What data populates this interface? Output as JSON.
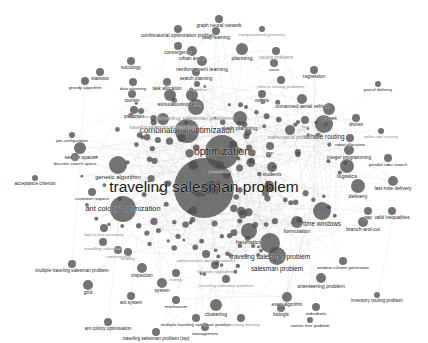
{
  "figure": {
    "type": "network-graph",
    "title": "",
    "background_color": "#ffffff",
    "node_color": "#4d4d4d",
    "edge_color": "#bdbdbd",
    "label_color": "#1a1a1a"
  },
  "chart_data": {
    "type": "scatter",
    "title": "",
    "xlabel": "",
    "ylabel": "",
    "grid": false,
    "legend": "none",
    "nodes": [
      {
        "label": "traveling salesman problem",
        "x": 204,
        "y": 188,
        "size": 30,
        "font": 15.5,
        "faint": false
      },
      {
        "label": "optimization",
        "x": 222,
        "y": 152,
        "size": 17,
        "font": 10.5,
        "faint": false
      },
      {
        "label": "combinatorial optimization",
        "x": 187,
        "y": 131,
        "size": 12,
        "font": 8.2,
        "faint": false
      },
      {
        "label": "ant colony optimization",
        "x": 123,
        "y": 209,
        "size": 13,
        "font": 7.4,
        "faint": false
      },
      {
        "label": "traveling salesman problems",
        "x": 196,
        "y": 107,
        "size": 8,
        "font": 6.0,
        "faint": true
      },
      {
        "label": "traveling salesman problem (tsp)",
        "x": 163,
        "y": 119,
        "size": 6,
        "font": 4.6,
        "faint": true
      },
      {
        "label": "time windows",
        "x": 322,
        "y": 211,
        "size": 9,
        "font": 6.3,
        "faint": false
      },
      {
        "label": "heuristics",
        "x": 249,
        "y": 231,
        "size": 8,
        "font": 6.2,
        "faint": false
      },
      {
        "label": "traveling salesman problem",
        "x": 270,
        "y": 243,
        "size": 10,
        "font": 6.6,
        "faint": false
      },
      {
        "label": "salesman problem",
        "x": 277,
        "y": 256,
        "size": 9,
        "font": 6.4,
        "faint": false
      },
      {
        "label": "formulation",
        "x": 297,
        "y": 222,
        "size": 6,
        "font": 5.4,
        "faint": false
      },
      {
        "label": "branch-and-cut",
        "x": 363,
        "y": 222,
        "size": 5,
        "font": 5.0,
        "faint": false
      },
      {
        "label": "valid inequalities",
        "x": 392,
        "y": 211,
        "size": 4,
        "font": 4.8,
        "faint": false
      },
      {
        "label": "gap",
        "x": 368,
        "y": 211,
        "size": 4,
        "font": 4.6,
        "faint": false
      },
      {
        "label": "delivery",
        "x": 358,
        "y": 186,
        "size": 7,
        "font": 5.6,
        "faint": false
      },
      {
        "label": "last-mile delivery",
        "x": 393,
        "y": 181,
        "size": 5,
        "font": 5.0,
        "faint": false
      },
      {
        "label": "logistics",
        "x": 347,
        "y": 166,
        "size": 7,
        "font": 5.6,
        "faint": false
      },
      {
        "label": "vehicle routing",
        "x": 324,
        "y": 124,
        "size": 9,
        "font": 6.4,
        "faint": false
      },
      {
        "label": "drones",
        "x": 329,
        "y": 109,
        "size": 6,
        "font": 5.2,
        "faint": false
      },
      {
        "label": "drones",
        "x": 356,
        "y": 118,
        "size": 4,
        "font": 4.6,
        "faint": false
      },
      {
        "label": "unmanned aerial vehicle",
        "x": 302,
        "y": 99,
        "size": 5,
        "font": 5.0,
        "faint": false
      },
      {
        "label": "robot allocation",
        "x": 350,
        "y": 138,
        "size": 4,
        "font": 4.4,
        "faint": false
      },
      {
        "label": "value-cap scenery",
        "x": 381,
        "y": 131,
        "size": 3,
        "font": 4.2,
        "faint": true
      },
      {
        "label": "integer programming",
        "x": 349,
        "y": 150,
        "size": 5,
        "font": 4.8,
        "faint": false
      },
      {
        "label": "parallel tabu search",
        "x": 388,
        "y": 158,
        "size": 4,
        "font": 4.4,
        "faint": false
      },
      {
        "label": "parcel delivery",
        "x": 378,
        "y": 84,
        "size": 3,
        "font": 4.4,
        "faint": false
      },
      {
        "label": "regression",
        "x": 314,
        "y": 70,
        "size": 4,
        "font": 4.8,
        "faint": false
      },
      {
        "label": "vehicle routing problems",
        "x": 281,
        "y": 80,
        "size": 4,
        "font": 4.4,
        "faint": true
      },
      {
        "label": "routing problems",
        "x": 276,
        "y": 51,
        "size": 4,
        "font": 4.6,
        "faint": true
      },
      {
        "label": "costs",
        "x": 274,
        "y": 63,
        "size": 4,
        "font": 4.4,
        "faint": false
      },
      {
        "label": "planning",
        "x": 242,
        "y": 49,
        "size": 6,
        "font": 5.6,
        "faint": false
      },
      {
        "label": "computational geometry",
        "x": 262,
        "y": 29,
        "size": 3,
        "font": 4.4,
        "faint": true
      },
      {
        "label": "graph neural network",
        "x": 219,
        "y": 19,
        "size": 4,
        "font": 4.8,
        "faint": false
      },
      {
        "label": "combinatorial optimization problem",
        "x": 178,
        "y": 29,
        "size": 4,
        "font": 4.8,
        "faint": false
      },
      {
        "label": "deep learning",
        "x": 216,
        "y": 31,
        "size": 4,
        "font": 4.6,
        "faint": false
      },
      {
        "label": "convergence",
        "x": 178,
        "y": 46,
        "size": 4,
        "font": 4.8,
        "faint": false
      },
      {
        "label": "urban areas",
        "x": 192,
        "y": 51,
        "size": 5,
        "font": 5.0,
        "faint": false
      },
      {
        "label": "reinforcement learning",
        "x": 202,
        "y": 61,
        "size": 5,
        "font": 5.2,
        "faint": false
      },
      {
        "label": "search planning",
        "x": 196,
        "y": 72,
        "size": 4,
        "font": 4.6,
        "faint": false
      },
      {
        "label": "completion",
        "x": 197,
        "y": 84,
        "size": 3,
        "font": 4.2,
        "faint": true
      },
      {
        "label": "sociology",
        "x": 131,
        "y": 61,
        "size": 4,
        "font": 4.8,
        "faint": false
      },
      {
        "label": "statistics",
        "x": 100,
        "y": 72,
        "size": 4,
        "font": 4.6,
        "faint": false
      },
      {
        "label": "greedy algorithm",
        "x": 85,
        "y": 81,
        "size": 4,
        "font": 4.4,
        "faint": false
      },
      {
        "label": "data planning",
        "x": 133,
        "y": 82,
        "size": 4,
        "font": 4.4,
        "faint": false
      },
      {
        "label": "task allocation",
        "x": 167,
        "y": 82,
        "size": 4,
        "font": 4.6,
        "faint": false
      },
      {
        "label": "tourism",
        "x": 132,
        "y": 94,
        "size": 4,
        "font": 4.6,
        "faint": false
      },
      {
        "label": "simulation",
        "x": 170,
        "y": 95,
        "size": 6,
        "font": 5.6,
        "faint": false
      },
      {
        "label": "modeling",
        "x": 192,
        "y": 95,
        "size": 6,
        "font": 5.4,
        "faint": false
      },
      {
        "label": "generation",
        "x": 141,
        "y": 111,
        "size": 3,
        "font": 4.0,
        "faint": true
      },
      {
        "label": "prediction",
        "x": 134,
        "y": 110,
        "size": 4,
        "font": 4.6,
        "faint": false
      },
      {
        "label": "path planning",
        "x": 240,
        "y": 118,
        "size": 7,
        "font": 5.8,
        "faint": false
      },
      {
        "label": "mathematical problem",
        "x": 290,
        "y": 130,
        "size": 5,
        "font": 4.6,
        "faint": true
      },
      {
        "label": "search space",
        "x": 80,
        "y": 148,
        "size": 6,
        "font": 5.2,
        "faint": false
      },
      {
        "label": "discrete search space",
        "x": 75,
        "y": 157,
        "size": 4,
        "font": 4.4,
        "faint": false
      },
      {
        "label": "pre-configuration",
        "x": 72,
        "y": 135,
        "size": 3,
        "font": 4.2,
        "faint": false
      },
      {
        "label": "acceptance criterion",
        "x": 35,
        "y": 178,
        "size": 3,
        "font": 4.6,
        "faint": false
      },
      {
        "label": "customer request",
        "x": 92,
        "y": 192,
        "size": 4,
        "font": 4.4,
        "faint": false
      },
      {
        "label": "genetic algorithm",
        "x": 118,
        "y": 165,
        "size": 9,
        "font": 6.0,
        "faint": false
      },
      {
        "label": "students",
        "x": 272,
        "y": 167,
        "size": 5,
        "font": 5.0,
        "faint": false
      },
      {
        "label": "presentation",
        "x": 220,
        "y": 165,
        "size": 4,
        "font": 4.2,
        "faint": true
      },
      {
        "label": "multiple traveling salesman problem",
        "x": 72,
        "y": 264,
        "size": 4,
        "font": 4.6,
        "faint": false
      },
      {
        "label": "inspection",
        "x": 142,
        "y": 268,
        "size": 5,
        "font": 4.8,
        "faint": false
      },
      {
        "label": "grid",
        "x": 88,
        "y": 285,
        "size": 5,
        "font": 5.0,
        "faint": false
      },
      {
        "label": "system",
        "x": 162,
        "y": 283,
        "size": 5,
        "font": 4.8,
        "faint": false
      },
      {
        "label": "ant system",
        "x": 131,
        "y": 296,
        "size": 4,
        "font": 4.6,
        "faint": false
      },
      {
        "label": "ant colony optimisation",
        "x": 108,
        "y": 322,
        "size": 4,
        "font": 4.6,
        "faint": false
      },
      {
        "label": "traveling salesman problem (tsp)",
        "x": 156,
        "y": 332,
        "size": 4,
        "font": 4.6,
        "faint": false
      },
      {
        "label": "multiple traveling salesman problem",
        "x": 196,
        "y": 318,
        "size": 4,
        "font": 4.4,
        "faint": false
      },
      {
        "label": "management",
        "x": 205,
        "y": 327,
        "size": 4,
        "font": 4.4,
        "faint": false
      },
      {
        "label": "opportunity hearing",
        "x": 241,
        "y": 318,
        "size": 4,
        "font": 4.4,
        "faint": true
      },
      {
        "label": "clustering",
        "x": 216,
        "y": 305,
        "size": 6,
        "font": 5.2,
        "faint": false
      },
      {
        "label": "mechanism",
        "x": 176,
        "y": 300,
        "size": 4,
        "font": 4.4,
        "faint": false
      },
      {
        "label": "exact algorithm",
        "x": 287,
        "y": 297,
        "size": 5,
        "font": 4.6,
        "faint": false
      },
      {
        "label": "biologis",
        "x": 281,
        "y": 308,
        "size": 4,
        "font": 4.6,
        "faint": false
      },
      {
        "label": "individuals",
        "x": 316,
        "y": 307,
        "size": 4,
        "font": 4.4,
        "faint": false
      },
      {
        "label": "steiner tree problem",
        "x": 310,
        "y": 320,
        "size": 3,
        "font": 4.4,
        "faint": false
      },
      {
        "label": "inventory routing problem",
        "x": 377,
        "y": 295,
        "size": 3,
        "font": 4.6,
        "faint": false
      },
      {
        "label": "orienteering problem",
        "x": 321,
        "y": 278,
        "size": 5,
        "font": 5.2,
        "faint": false
      },
      {
        "label": "window column generation",
        "x": 343,
        "y": 261,
        "size": 4,
        "font": 4.4,
        "faint": false
      },
      {
        "label": "traveling salesman problem",
        "x": 226,
        "y": 279,
        "size": 4,
        "font": 4.4,
        "faint": true
      },
      {
        "label": "heuristic algorithm",
        "x": 215,
        "y": 265,
        "size": 4,
        "font": 4.4,
        "faint": true
      },
      {
        "label": "adhesiveness based networks",
        "x": 206,
        "y": 254,
        "size": 4,
        "font": 4.4,
        "faint": true
      },
      {
        "label": "energy",
        "x": 176,
        "y": 273,
        "size": 4,
        "font": 4.2,
        "faint": true
      },
      {
        "label": "travelling salesman",
        "x": 103,
        "y": 242,
        "size": 4,
        "font": 4.4,
        "faint": true
      },
      {
        "label": "logical test reasoning",
        "x": 104,
        "y": 228,
        "size": 4,
        "font": 4.2,
        "faint": true
      },
      {
        "label": "combinatorial",
        "x": 118,
        "y": 250,
        "size": 4,
        "font": 4.2,
        "faint": true
      },
      {
        "label": "mobility",
        "x": 128,
        "y": 252,
        "size": 4,
        "font": 4.2,
        "faint": true
      },
      {
        "label": "taxi",
        "x": 270,
        "y": 146,
        "size": 4,
        "font": 4.4,
        "faint": false
      },
      {
        "label": "vehicle",
        "x": 262,
        "y": 94,
        "size": 4,
        "font": 4.6,
        "faint": false
      },
      {
        "label": "flow",
        "x": 305,
        "y": 120,
        "size": 4,
        "font": 4.2,
        "faint": true
      }
    ]
  }
}
